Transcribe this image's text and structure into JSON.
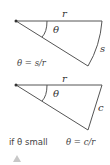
{
  "diagrams": [
    {
      "name": "arc-sector",
      "labels": {
        "radius": "r",
        "angle": "θ",
        "side": "s"
      },
      "formula": "θ = s/r"
    },
    {
      "name": "chord-triangle",
      "labels": {
        "radius": "r",
        "angle": "θ",
        "side": "c"
      },
      "caption_prefix": "if θ small",
      "formula": "θ = c/r"
    }
  ],
  "colors": {
    "line": "#555555",
    "text": "#333333",
    "marker": "#c8c8c8"
  }
}
